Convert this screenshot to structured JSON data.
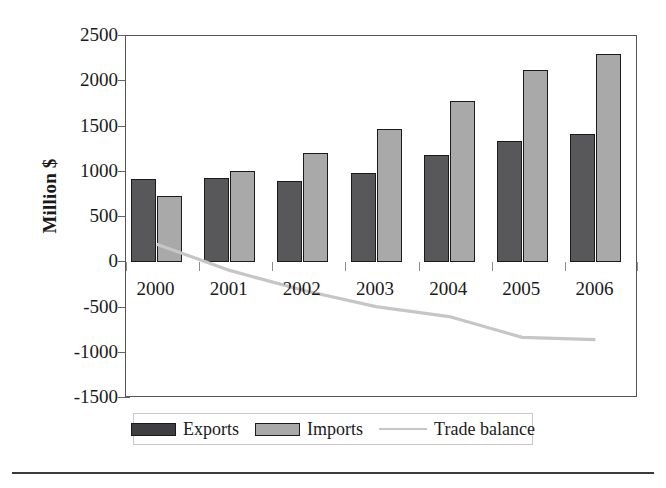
{
  "chart_data": {
    "type": "bar",
    "title": "",
    "xlabel": "",
    "ylabel": "Million $",
    "categories": [
      "2000",
      "2001",
      "2002",
      "2003",
      "2004",
      "2005",
      "2006"
    ],
    "ylim": [
      -1500,
      2500
    ],
    "ytick_values": [
      2500,
      2000,
      1500,
      1000,
      500,
      0,
      -500,
      -1000,
      -1500
    ],
    "ytick_labels": [
      "2500",
      "2000",
      "1500",
      "1000",
      "500",
      "0",
      "-500",
      "-1000",
      "-1500"
    ],
    "grid": false,
    "legend_position": "bottom",
    "series": [
      {
        "name": "Exports",
        "kind": "bar",
        "color": "#58585a",
        "values": [
          920,
          930,
          900,
          985,
          1190,
          1345,
          1415
        ]
      },
      {
        "name": "Imports",
        "kind": "bar",
        "color": "#a9a9a9",
        "values": [
          730,
          1010,
          1205,
          1475,
          1785,
          2120,
          2305
        ]
      },
      {
        "name": "Trade balance",
        "kind": "line",
        "color": "#c6c6c6",
        "values": [
          200,
          -90,
          -310,
          -490,
          -600,
          -830,
          -855
        ]
      }
    ]
  },
  "legend": {
    "exports_label": "Exports",
    "imports_label": "Imports",
    "balance_label": "Trade balance"
  },
  "axis": {
    "y_title": "Million $"
  }
}
